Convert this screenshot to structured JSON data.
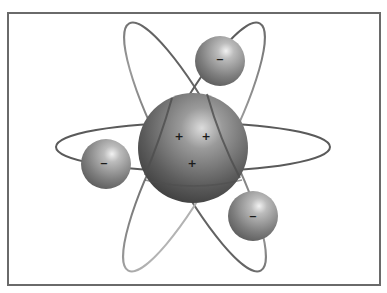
{
  "diagram": {
    "nucleus": {
      "charges": [
        {
          "symbol": "+",
          "x": 179,
          "y": 137
        },
        {
          "symbol": "+",
          "x": 206,
          "y": 137
        },
        {
          "symbol": "+",
          "x": 192,
          "y": 164
        }
      ]
    },
    "electrons": [
      {
        "name": "top",
        "symbol": "−",
        "cx": 220,
        "cy": 61,
        "r": 25
      },
      {
        "name": "left",
        "symbol": "−",
        "cx": 106,
        "cy": 164,
        "r": 25
      },
      {
        "name": "bottom-right",
        "symbol": "−",
        "cx": 253,
        "cy": 216,
        "r": 25
      }
    ],
    "colors": {
      "frame": "#6a6a6a",
      "orbit": "#5a5a5a",
      "sphere_light": "#d8d8d8",
      "sphere_mid": "#8a8a8a",
      "sphere_dark": "#3e3e3e"
    }
  }
}
